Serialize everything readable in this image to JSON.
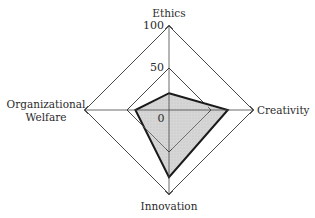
{
  "chart_data": {
    "type": "radar",
    "title": "",
    "axes": [
      "Ethics",
      "Creativity",
      "Innovation",
      "Organizational Welfare"
    ],
    "axis_labels": {
      "top": "Ethics",
      "right": "Creativity",
      "bottom": "Innovation",
      "left_line1": "Organizational",
      "left_line2": "Welfare"
    },
    "tick_labels": {
      "max": "100",
      "mid": "50",
      "min": "0"
    },
    "range": [
      0,
      100
    ],
    "gridlines": [
      50,
      100
    ],
    "series": [
      {
        "name": "Profile",
        "values": [
          20,
          70,
          80,
          40
        ],
        "fill": "#d4d4d4",
        "stroke": "#1a1a1a"
      }
    ],
    "grid_color": "#333333",
    "legend": "none"
  }
}
